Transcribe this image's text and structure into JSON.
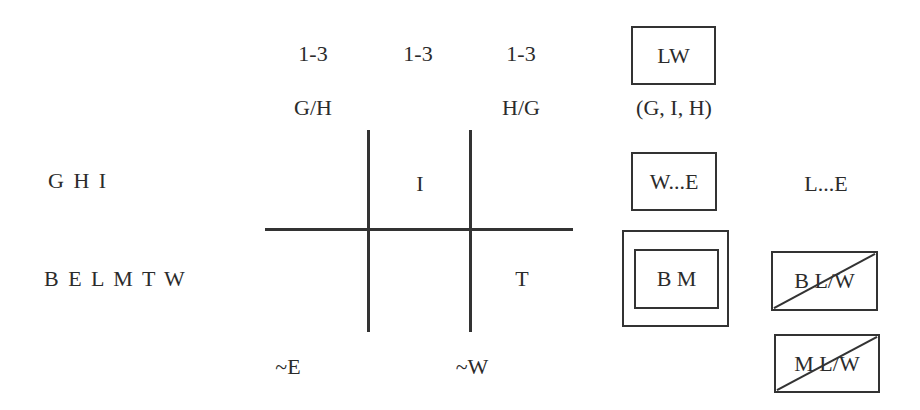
{
  "diagram": {
    "column_headers": {
      "counts": [
        "1-3",
        "1-3",
        "1-3"
      ],
      "labels": [
        "G/H",
        "",
        "H/G"
      ]
    },
    "row_labels": [
      "G H I",
      "B E L M T W"
    ],
    "grid_cells": {
      "row1_middle": "I",
      "row2_right": "T"
    },
    "bottom_labels": [
      "~E",
      "~W"
    ],
    "right_panel": {
      "lw_box": "LW",
      "lw_caption": "(G, I, H)",
      "we_box": "W...E",
      "le_text": "L...E",
      "bm_double_box": "B M",
      "blw_crossed_box": "B L/W",
      "mlw_crossed_box": "M L/W"
    },
    "colors": {
      "ink": "#2b2b2b",
      "line": "#333333",
      "background": "#ffffff"
    }
  }
}
